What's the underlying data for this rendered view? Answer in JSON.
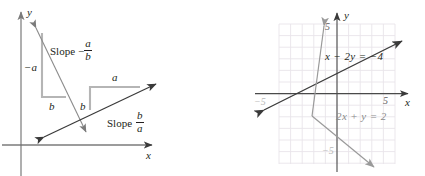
{
  "figure": {
    "title": "",
    "panels": [
      {
        "id": "left",
        "name": "slope-illustration",
        "axes": {
          "x_label": "x",
          "y_label": "y"
        },
        "annotations": {
          "neg_a": "−a",
          "b_left": "b",
          "b_right": "b",
          "a_right": "a",
          "slope_word_1": "Slope",
          "slope_sign_1": "−",
          "slope_num_1": "a",
          "slope_den_1": "b",
          "slope_word_2": "Slope",
          "slope_num_2": "b",
          "slope_den_2": "a"
        },
        "lines": [
          {
            "name": "negative-slope-line",
            "slope_label": "Slope −a/b",
            "color": "#6d6d6d"
          },
          {
            "name": "positive-slope-line",
            "slope_label": "Slope b/a",
            "color": "#3a3a3a"
          }
        ]
      },
      {
        "id": "right",
        "name": "system-of-equations-graph",
        "axes": {
          "x_label": "x",
          "y_label": "y",
          "x_ticks": [
            "−5",
            "5"
          ],
          "y_ticks": [
            "5",
            "−5"
          ],
          "xlim": [
            -6,
            6
          ],
          "ylim": [
            -6,
            6
          ],
          "grid": true
        },
        "equations": [
          {
            "name": "line-x-minus-2y",
            "label": "x − 2y = −4",
            "color": "#3a3a3a",
            "slope": 0.5,
            "intercept": 2
          },
          {
            "name": "line-2x-plus-y",
            "label": "2x + y = 2",
            "color": "#9a9a9a",
            "slope": -2,
            "intercept": 2
          }
        ],
        "intersection": {
          "x": 0,
          "y": 2
        }
      }
    ]
  },
  "colors": {
    "axis": "#3a3a3a",
    "grid": "#e9e4ea",
    "dark_line": "#3a3a3a",
    "mid_line": "#6d6d6d",
    "light_line": "#a9a9a9",
    "step_gray": "#b5b5b5",
    "text": "#231f20",
    "tick_text": "#5f5f5f"
  }
}
